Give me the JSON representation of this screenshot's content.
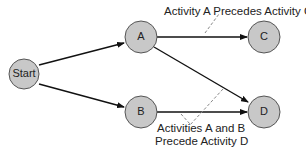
{
  "nodes": {
    "start": {
      "label": "Start"
    },
    "a": {
      "label": "A"
    },
    "b": {
      "label": "B"
    },
    "c": {
      "label": "C"
    },
    "d": {
      "label": "D"
    }
  },
  "annotations": {
    "a_precedes_c": "Activity A Precedes Activity C",
    "ab_precede_d_line1": "Activities A and B",
    "ab_precede_d_line2": "Precede Activity D"
  },
  "colors": {
    "node_fill": "#c8c8c8",
    "node_stroke": "#555555",
    "edge": "#111111",
    "leader": "#888888"
  }
}
